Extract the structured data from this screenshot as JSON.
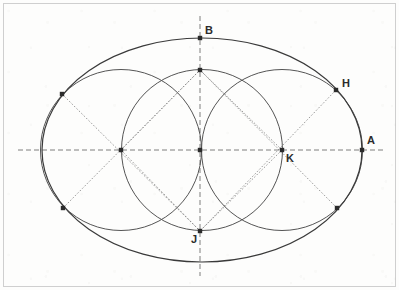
{
  "figure": {
    "canvas": {
      "width": 399,
      "height": 290,
      "background": "#fdfdfc"
    },
    "colors": {
      "ellipse_stroke": "#3a3a3a",
      "circle_stroke": "#555555",
      "axis_stroke": "#707070",
      "diagonal_stroke": "#808080",
      "point_fill": "#2b2b2b",
      "label_fill": "#2b2b2b",
      "border_stroke": "#cfcfcf"
    },
    "ellipse": {
      "center_x": 202,
      "center_y": 150,
      "semi_major_a": 160,
      "semi_minor_b": 112,
      "stroke_width": 1.2
    },
    "circles": [
      {
        "name": "left-circle",
        "cx": 121,
        "cy": 150,
        "r": 80.5
      },
      {
        "name": "middle-circle",
        "cx": 202,
        "cy": 150,
        "r": 80.5
      },
      {
        "name": "right-circle",
        "cx": 282,
        "cy": 150,
        "r": 80.5
      }
    ],
    "axes": {
      "horizontal": {
        "x1": 18,
        "y1": 150,
        "x2": 384,
        "y2": 150,
        "dash": "5,3"
      },
      "vertical": {
        "x1": 200,
        "y1": 16,
        "x2": 200,
        "y2": 276,
        "dash": "5,3"
      }
    },
    "diagonals": [
      {
        "name": "diagonal-upper-left",
        "x1": 62,
        "y1": 94,
        "x2": 200,
        "y2": 231
      },
      {
        "name": "diagonal-lower-left",
        "x1": 63,
        "y1": 208,
        "x2": 200,
        "y2": 70
      },
      {
        "name": "diagonal-upper-right",
        "x1": 336,
        "y1": 90,
        "x2": 200,
        "y2": 231
      },
      {
        "name": "diagonal-lower-right",
        "x1": 337,
        "y1": 208,
        "x2": 200,
        "y2": 70
      },
      {
        "name": "diagonal-left-center-up",
        "x1": 121,
        "y1": 150,
        "x2": 200,
        "y2": 70
      },
      {
        "name": "diagonal-left-center-down",
        "x1": 121,
        "y1": 150,
        "x2": 200,
        "y2": 231
      },
      {
        "name": "diagonal-right-center-up",
        "x1": 282,
        "y1": 150,
        "x2": 200,
        "y2": 70
      },
      {
        "name": "diagonal-right-center-down",
        "x1": 282,
        "y1": 150,
        "x2": 200,
        "y2": 231
      }
    ],
    "points": [
      {
        "id": "A",
        "label": "A",
        "x": 362,
        "y": 150,
        "label_dx": 5,
        "label_dy": -6
      },
      {
        "id": "B",
        "label": "B",
        "x": 200,
        "y": 38,
        "label_dx": 5,
        "label_dy": -4
      },
      {
        "id": "H",
        "label": "H",
        "x": 336,
        "y": 90,
        "label_dx": 6,
        "label_dy": -3
      },
      {
        "id": "J",
        "label": "J",
        "x": 200,
        "y": 231,
        "label_dx": -9,
        "label_dy": 12
      },
      {
        "id": "K",
        "label": "K",
        "x": 282,
        "y": 150,
        "label_dx": 4,
        "label_dy": 12
      },
      {
        "id": "C",
        "label": "",
        "x": 121,
        "y": 150,
        "label_dx": 0,
        "label_dy": 0
      },
      {
        "id": "O",
        "label": "",
        "x": 200,
        "y": 150,
        "label_dx": 0,
        "label_dy": 0
      },
      {
        "id": "T",
        "label": "",
        "x": 200,
        "y": 70,
        "label_dx": 0,
        "label_dy": 0
      },
      {
        "id": "P",
        "label": "",
        "x": 62,
        "y": 94,
        "label_dx": 0,
        "label_dy": 0
      },
      {
        "id": "Q",
        "label": "",
        "x": 63,
        "y": 208,
        "label_dx": 0,
        "label_dy": 0
      },
      {
        "id": "R",
        "label": "",
        "x": 337,
        "y": 208,
        "label_dx": 0,
        "label_dy": 0
      }
    ]
  }
}
